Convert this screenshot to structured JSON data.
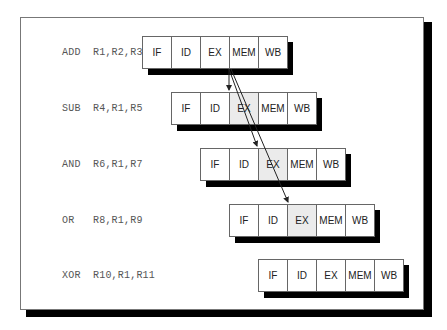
{
  "diagram": {
    "type": "pipeline-data-hazard",
    "stages": [
      "IF",
      "ID",
      "EX",
      "MEM",
      "WB"
    ],
    "rows": [
      {
        "instruction": "ADD  R1,R2,R3",
        "highlight_stage": null
      },
      {
        "instruction": "SUB  R4,R1,R5",
        "highlight_stage": "EX"
      },
      {
        "instruction": "AND  R6,R1,R7",
        "highlight_stage": "EX"
      },
      {
        "instruction": "OR   R8,R1,R9",
        "highlight_stage": "EX"
      },
      {
        "instruction": "XOR  R10,R1,R11",
        "highlight_stage": null
      }
    ],
    "dependency_arrows": [
      {
        "from": "ADD.EX/MEM boundary",
        "to": "SUB.EX"
      },
      {
        "from": "ADD.EX/MEM boundary",
        "to": "AND.EX"
      },
      {
        "from": "ADD.EX/MEM boundary",
        "to": "OR.EX"
      }
    ],
    "colors": {
      "highlight": "#ebebeb",
      "shadow": "#000000",
      "border": "#666666"
    }
  },
  "labels": {
    "r0": "ADD  R1,R2,R3",
    "r1": "SUB  R4,R1,R5",
    "r2": "AND  R6,R1,R7",
    "r3": "OR   R8,R1,R9",
    "r4": "XOR  R10,R1,R11"
  },
  "stages": {
    "s0": "IF",
    "s1": "ID",
    "s2": "EX",
    "s3": "MEM",
    "s4": "WB"
  }
}
